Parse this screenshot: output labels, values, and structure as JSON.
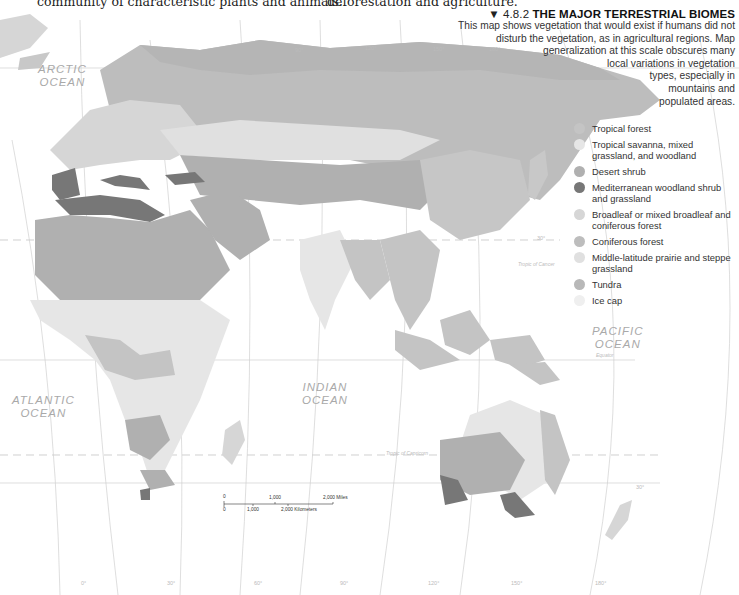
{
  "body_text": {
    "left_fragment": "community of characteristic plants and animals.",
    "right_fragment": "deforestation and agriculture."
  },
  "figure": {
    "number_marker": "▼",
    "number": "4.8.2",
    "title": "THE MAJOR TERRESTRIAL BIOMES",
    "description_lines": [
      "This map shows vegetation that would exist if humans did not",
      "disturb the vegetation, as in agricultural regions. Map",
      "generalization at this scale obscures many",
      "local variations in vegetation",
      "types, especially in",
      "mountains and",
      "populated areas."
    ]
  },
  "legend": {
    "items": [
      {
        "label": "Tropical forest",
        "color": "#c4c4c4"
      },
      {
        "label": "Tropical savanna, mixed grassland, and woodland",
        "color": "#e6e6e6"
      },
      {
        "label": "Desert shrub",
        "color": "#b0b0b0"
      },
      {
        "label": "Mediterranean woodland shrub and grassland",
        "color": "#777777"
      },
      {
        "label": "Broadleaf or mixed broadleaf and coniferous forest",
        "color": "#d6d6d6"
      },
      {
        "label": "Coniferous forest",
        "color": "#bdbdbd"
      },
      {
        "label": "Middle-latitude prairie and steppe grassland",
        "color": "#e0e0e0"
      },
      {
        "label": "Tundra",
        "color": "#b8b8b8"
      },
      {
        "label": "Ice cap",
        "color": "#efefef"
      }
    ]
  },
  "map": {
    "oceans": [
      {
        "name": "ARCTIC",
        "name2": "OCEAN"
      },
      {
        "name": "ATLANTIC",
        "name2": "OCEAN"
      },
      {
        "name": "INDIAN",
        "name2": "OCEAN"
      },
      {
        "name": "PACIFIC",
        "name2": "OCEAN"
      }
    ],
    "lines": {
      "tropic_cancer": "Tropic of Cancer",
      "equator": "Equator",
      "tropic_capricorn": "Tropic of Capricorn"
    },
    "latitudes": [
      "30°",
      "0°",
      "30°"
    ],
    "longitudes": [
      "0°",
      "30°",
      "60°",
      "90°",
      "120°",
      "150°",
      "180°"
    ],
    "top_longitudes": [
      "90°",
      "120°",
      "150°",
      "180°"
    ]
  },
  "scale_bar": {
    "miles_zero": "0",
    "miles_mid": "1,000",
    "miles_end": "2,000 Miles",
    "km_zero": "0",
    "km_mid": "1,000",
    "km_end": "2,000 Kilometers"
  }
}
